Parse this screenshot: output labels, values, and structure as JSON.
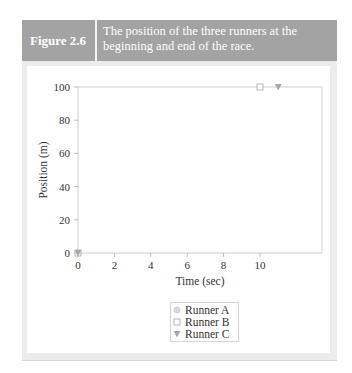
{
  "figure": {
    "label": "Figure 2.6",
    "caption": "The position of the three runners at the beginning and end of the race."
  },
  "chart_data": {
    "type": "scatter",
    "title": "The position of the three runners at the beginning and end of the race.",
    "xlabel": "Time (sec)",
    "ylabel": "Position (m)",
    "xlim": [
      0,
      12
    ],
    "ylim": [
      0,
      100
    ],
    "x_ticks": [
      0,
      2,
      4,
      6,
      8,
      10
    ],
    "y_ticks": [
      0,
      20,
      40,
      60,
      80,
      100
    ],
    "grid": false,
    "legend_position": "below",
    "series": [
      {
        "name": "Runner A",
        "marker": "circle",
        "color": "#c9c9c9",
        "points": [
          [
            0,
            0
          ]
        ]
      },
      {
        "name": "Runner B",
        "marker": "square",
        "color": "#b5b5b5",
        "points": [
          [
            0,
            0
          ],
          [
            10,
            100
          ]
        ]
      },
      {
        "name": "Runner C",
        "marker": "triangle-down",
        "color": "#a0a0a0",
        "points": [
          [
            0,
            0
          ],
          [
            11,
            100
          ]
        ]
      }
    ]
  },
  "axes": {
    "x_title": "Time (sec)",
    "y_title": "Position (m)",
    "x_tick_labels": [
      "0",
      "2",
      "4",
      "6",
      "8",
      "10"
    ],
    "y_tick_labels": [
      "0",
      "20",
      "40",
      "60",
      "80",
      "100"
    ]
  },
  "legend": {
    "items": [
      {
        "label": "Runner A",
        "marker": "circle"
      },
      {
        "label": "Runner B",
        "marker": "square"
      },
      {
        "label": "Runner C",
        "marker": "triangle-down"
      }
    ]
  }
}
